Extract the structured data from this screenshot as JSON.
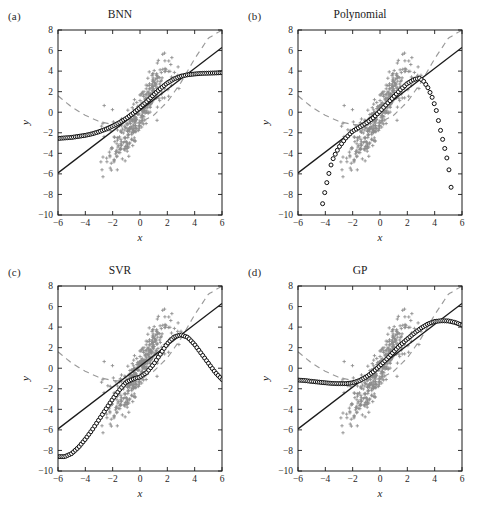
{
  "figure": {
    "layout": "2x2-grid",
    "width": 480,
    "height": 513,
    "background": "#ffffff"
  },
  "panels": [
    {
      "key": "a",
      "label": "(a)",
      "title": "BNN"
    },
    {
      "key": "b",
      "label": "(b)",
      "title": "Polynomial"
    },
    {
      "key": "c",
      "label": "(c)",
      "title": "SVR"
    },
    {
      "key": "d",
      "label": "(d)",
      "title": "GP"
    }
  ],
  "axes": {
    "xlabel": "x",
    "ylabel": "y",
    "xlim": [
      -6,
      6
    ],
    "ylim": [
      -10,
      8
    ],
    "xticks": [
      -6,
      -4,
      -2,
      0,
      2,
      4,
      6
    ],
    "yticks": [
      8,
      6,
      4,
      2,
      0,
      -2,
      -4,
      -6,
      -8,
      -10
    ],
    "xtick_labels": [
      "−6",
      "−4",
      "−2",
      "0",
      "2",
      "4",
      "6"
    ],
    "ytick_labels": [
      "8",
      "6",
      "4",
      "2",
      "0",
      "−2",
      "−4",
      "−6",
      "−8",
      "−10"
    ],
    "grid": false,
    "tick_direction": "in"
  },
  "colors": {
    "scatter": "#8c8c8c",
    "line_solid": "#1a1a1a",
    "line_dashed": "#9a9a9a",
    "marker_edge": "#0d0d0d",
    "marker_fill": "#ffffff",
    "frame": "#1a1a1a",
    "text": "#1a1a1a"
  },
  "chart_data": {
    "type": "scatter",
    "xlabel": "x",
    "ylabel": "y",
    "xlim": [
      -6,
      6
    ],
    "ylim": [
      -10,
      8
    ],
    "grid": false,
    "legend": "none",
    "shared_series": {
      "scatter_points": {
        "name": "Training data",
        "marker": "plus",
        "color": "#8c8c8c",
        "count": 400,
        "x_range": [
          -2.6,
          2.9
        ],
        "y_range": [
          -3.6,
          5.0
        ],
        "description": "Dense gray plus markers clustered along an S-shaped trend, concentrated between x=-2.5 and x=2.8"
      },
      "solid_line": {
        "name": "Linear reference",
        "style": "solid",
        "color": "#1a1a1a",
        "x": [
          -6,
          6
        ],
        "y": [
          -5.9,
          6.3
        ],
        "slope": 1.017,
        "intercept": 0.2
      },
      "dashed_curve": {
        "name": "Quadratic reference",
        "style": "dashed",
        "color": "#9a9a9a",
        "x": [
          -6,
          -5,
          -4,
          -3,
          -2,
          -1,
          0,
          1,
          2,
          3,
          4,
          5,
          6
        ],
        "y": [
          1.6,
          0.5,
          -0.3,
          -0.9,
          -1.2,
          -1.25,
          -1.0,
          -0.3,
          1.0,
          2.9,
          5.2,
          7.2,
          8.0
        ],
        "description": "U-shaped dashed curve with minimum near x=-1, rising steeply beyond x=2"
      }
    },
    "panels": [
      {
        "key": "a",
        "label": "(a)",
        "title": "BNN",
        "prediction": {
          "name": "BNN prediction",
          "marker": "open-circle",
          "color": "#0d0d0d",
          "x": [
            -6,
            -5.5,
            -5,
            -4.5,
            -4,
            -3.5,
            -3,
            -2.5,
            -2,
            -1.5,
            -1,
            -0.5,
            0,
            0.5,
            1,
            1.5,
            2,
            2.5,
            3,
            3.5,
            4,
            4.5,
            5,
            5.5,
            6
          ],
          "y": [
            -2.55,
            -2.5,
            -2.45,
            -2.35,
            -2.25,
            -2.1,
            -1.9,
            -1.65,
            -1.35,
            -1.0,
            -0.6,
            -0.1,
            0.45,
            1.05,
            1.7,
            2.3,
            2.85,
            3.25,
            3.5,
            3.65,
            3.72,
            3.78,
            3.8,
            3.82,
            3.85
          ],
          "description": "Smooth saturating sigmoid: flat near y=-2.5 at left, flat near y=3.8 at right"
        }
      },
      {
        "key": "b",
        "label": "(b)",
        "title": "Polynomial",
        "prediction": {
          "name": "Polynomial prediction",
          "marker": "open-circle",
          "color": "#0d0d0d",
          "x": [
            -4.2,
            -4.0,
            -3.8,
            -3.6,
            -3.4,
            -3.2,
            -3.0,
            -2.5,
            -2.0,
            -1.5,
            -1.0,
            -0.5,
            0,
            0.5,
            1.0,
            1.5,
            2.0,
            2.5,
            2.9,
            3.2,
            3.5,
            3.8,
            4.1,
            4.4,
            4.7,
            5.0,
            5.2
          ],
          "y": [
            -8.9,
            -7.5,
            -6.3,
            -5.2,
            -4.4,
            -3.9,
            -3.4,
            -2.5,
            -1.85,
            -1.45,
            -1.05,
            -0.55,
            0.1,
            0.8,
            1.5,
            2.2,
            2.8,
            3.2,
            3.3,
            3.0,
            2.4,
            1.5,
            0.3,
            -1.6,
            -3.3,
            -5.1,
            -7.3
          ],
          "description": "High-order polynomial: fits center well, diverges steeply downward at both tails, falling off-scale below y=-10"
        }
      },
      {
        "key": "c",
        "label": "(c)",
        "title": "SVR",
        "prediction": {
          "name": "SVR prediction",
          "marker": "open-circle",
          "color": "#0d0d0d",
          "x": [
            -6,
            -5.5,
            -5,
            -4.5,
            -4,
            -3.5,
            -3,
            -2.5,
            -2,
            -1.5,
            -1,
            -0.5,
            0,
            0.5,
            1,
            1.5,
            2,
            2.5,
            3,
            3.5,
            4,
            4.5,
            5,
            5.5,
            6
          ],
          "y": [
            -8.6,
            -8.6,
            -8.3,
            -7.7,
            -6.9,
            -6.0,
            -5.0,
            -4.0,
            -3.0,
            -2.1,
            -1.35,
            -1.05,
            -0.85,
            -0.4,
            0.4,
            1.4,
            2.4,
            3.05,
            3.25,
            3.0,
            2.3,
            1.4,
            0.5,
            -0.4,
            -1.1
          ],
          "description": "Flat plateau near y=-8.6 at far left, rises through the data, peaks near x=3 at y=3.25, then declines linearly to y=-1.1 at x=6"
        }
      },
      {
        "key": "d",
        "label": "(d)",
        "title": "GP",
        "prediction": {
          "name": "GP prediction",
          "marker": "open-circle",
          "color": "#0d0d0d",
          "x": [
            -6,
            -5.5,
            -5,
            -4.5,
            -4,
            -3.5,
            -3,
            -2.5,
            -2,
            -1.5,
            -1,
            -0.5,
            0,
            0.5,
            1,
            1.5,
            2,
            2.5,
            3,
            3.5,
            4,
            4.5,
            5,
            5.5,
            6
          ],
          "y": [
            -1.15,
            -1.2,
            -1.28,
            -1.35,
            -1.42,
            -1.48,
            -1.5,
            -1.5,
            -1.42,
            -1.2,
            -0.85,
            -0.35,
            0.25,
            0.9,
            1.6,
            2.25,
            2.85,
            3.4,
            3.9,
            4.3,
            4.55,
            4.62,
            4.6,
            4.45,
            4.2
          ],
          "description": "Gentle valley near y=-1.5 on the left, smooth rise through the data, peaks near x=4.6 at y=4.62, slight decline toward x=6"
        }
      }
    ]
  }
}
